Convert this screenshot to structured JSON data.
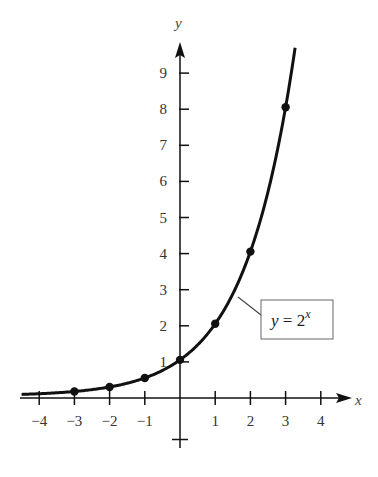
{
  "chart_data": {
    "type": "line",
    "title": "",
    "xlabel": "x",
    "ylabel": "y",
    "function": "y = 2^x",
    "annotation": {
      "text_base": "y = 2",
      "text_exp": "x"
    },
    "x_ticks": [
      -4,
      -3,
      -2,
      -1,
      1,
      2,
      3,
      4
    ],
    "y_ticks": [
      1,
      2,
      3,
      4,
      5,
      6,
      7,
      8,
      9
    ],
    "x_tick_labels": [
      "−4",
      "−3",
      "−2",
      "−1",
      "1",
      "2",
      "3",
      "4"
    ],
    "y_tick_labels": [
      "1",
      "2",
      "3",
      "4",
      "5",
      "6",
      "7",
      "8",
      "9"
    ],
    "xlim": [
      -4.5,
      4.7
    ],
    "ylim": [
      -1.4,
      10.0
    ],
    "grid": false,
    "legend_position": "callout box right of curve near y=2",
    "points": [
      {
        "x": -3,
        "y": 0.125
      },
      {
        "x": -2,
        "y": 0.25
      },
      {
        "x": -1,
        "y": 0.5
      },
      {
        "x": 0,
        "y": 1
      },
      {
        "x": 1,
        "y": 2
      },
      {
        "x": 2,
        "y": 4
      },
      {
        "x": 3,
        "y": 8
      }
    ],
    "curve_x_range": [
      -4.5,
      3.27
    ]
  },
  "colors": {
    "stroke": "#111111",
    "text": "#333333",
    "background": "#ffffff"
  }
}
